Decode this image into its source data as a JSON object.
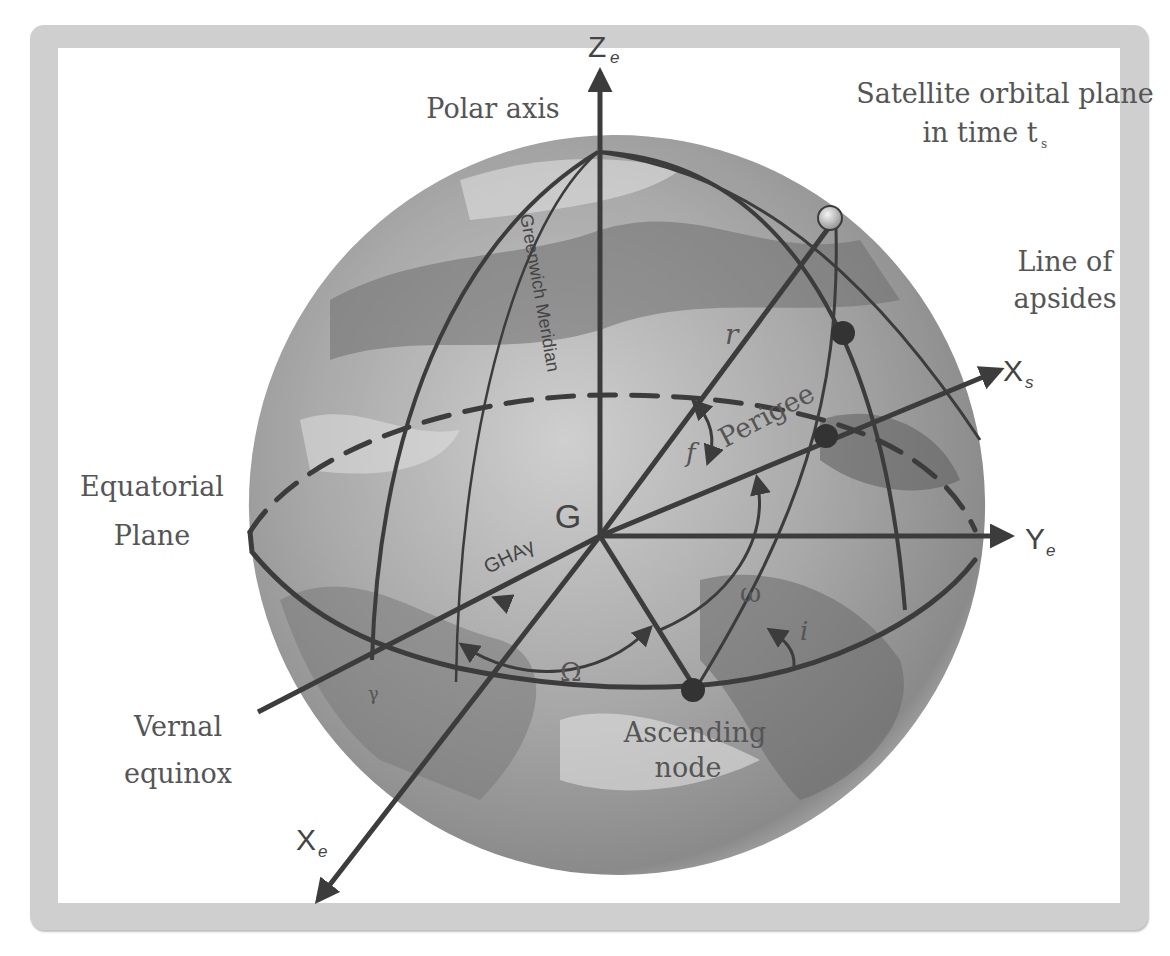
{
  "figure": {
    "labels": {
      "polar_axis": "Polar axis",
      "orbital_plane_line1": "Satellite orbital plane",
      "orbital_plane_line2": "in time t",
      "orbital_plane_sub": "s",
      "line_of_apsides_line1": "Line of",
      "line_of_apsides_line2": "apsides",
      "equatorial_plane_line1": "Equatorial",
      "equatorial_plane_line2": "Plane",
      "vernal_equinox_line1": "Vernal",
      "vernal_equinox_line2": "equinox",
      "ascending_node_line1": "Ascending",
      "ascending_node_line2": "node",
      "perigee": "Perigee",
      "greenwich_meridian": "Greenwich Meridian",
      "center": "G",
      "gha": "GHAγ",
      "radius": "r",
      "true_anomaly": "f",
      "arg_perigee": "ω",
      "raan": "Ω",
      "inclination": "i",
      "vernal_symbol": "γ"
    },
    "axes": {
      "ze": {
        "main": "Z",
        "sub": "e"
      },
      "ye": {
        "main": "Y",
        "sub": "e"
      },
      "xe": {
        "main": "X",
        "sub": "e"
      },
      "xs": {
        "main": "X",
        "sub": "s"
      }
    },
    "colors": {
      "frame": "#cfcfcf",
      "line": "#3c3c3c",
      "globe_light": "#c9c9c9",
      "globe_dark": "#7a7a7a",
      "text": "#555555"
    }
  }
}
